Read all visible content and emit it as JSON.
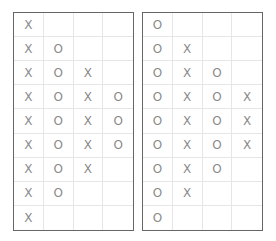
{
  "colors": {
    "mark": "#8a8a8a",
    "border": "#666666",
    "grid": "#e6e6e6"
  },
  "boards": [
    {
      "name": "left",
      "rows": [
        [
          "X",
          "",
          "",
          ""
        ],
        [
          "X",
          "O",
          "",
          ""
        ],
        [
          "X",
          "O",
          "X",
          ""
        ],
        [
          "X",
          "O",
          "X",
          "O"
        ],
        [
          "X",
          "O",
          "X",
          "O"
        ],
        [
          "X",
          "O",
          "X",
          "O"
        ],
        [
          "X",
          "O",
          "X",
          ""
        ],
        [
          "X",
          "O",
          "",
          ""
        ],
        [
          "X",
          "",
          "",
          ""
        ]
      ]
    },
    {
      "name": "right",
      "rows": [
        [
          "O",
          "",
          "",
          ""
        ],
        [
          "O",
          "X",
          "",
          ""
        ],
        [
          "O",
          "X",
          "O",
          ""
        ],
        [
          "O",
          "X",
          "O",
          "X"
        ],
        [
          "O",
          "X",
          "O",
          "X"
        ],
        [
          "O",
          "X",
          "O",
          "X"
        ],
        [
          "O",
          "X",
          "O",
          ""
        ],
        [
          "O",
          "X",
          "",
          ""
        ],
        [
          "O",
          "",
          "",
          ""
        ]
      ]
    }
  ]
}
